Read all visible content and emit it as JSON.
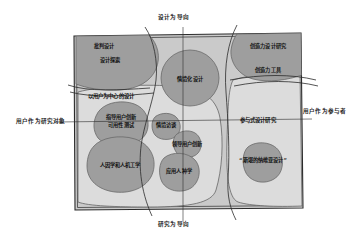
{
  "diagram": {
    "title_axes": {
      "top": "设计为导向",
      "bottom": "研究为导向",
      "left": "用户作为研究对象",
      "right": "用户作为参与者"
    },
    "regions": [
      {
        "id": "user-centered-design",
        "label": "以用户为中心的设计",
        "fill": "#d8d8d8"
      },
      {
        "id": "participatory-design-research",
        "label": "参与式设计研究",
        "fill": "#d8d8d8"
      }
    ],
    "clusters": [
      {
        "id": "critical-design",
        "label": "批判设计",
        "fill": "#9a9a9a"
      },
      {
        "id": "design-exploration",
        "label": "设计探索",
        "fill": "#9a9a9a"
      },
      {
        "id": "creativity-design-research",
        "label": "创造力设计研究",
        "fill": "#9a9a9a"
      },
      {
        "id": "creativity-tools",
        "label": "创造力工具",
        "fill": "#9a9a9a"
      },
      {
        "id": "contextual-design",
        "label": "情境化设计",
        "fill": "#9a9a9a"
      },
      {
        "id": "lead-user-innovation-usability",
        "label_line1": "指导用户创新",
        "label_line2": "可用性测试",
        "fill": "#9a9a9a"
      },
      {
        "id": "contextual-inquiry",
        "label": "情境访谈",
        "fill": "#9a9a9a"
      },
      {
        "id": "lead-user-innovation",
        "label": "领导用户创新",
        "fill": "#9a9a9a"
      },
      {
        "id": "human-factors-ergonomics",
        "label": "人因学和人机工学",
        "fill": "#9a9a9a"
      },
      {
        "id": "applied-ethnography",
        "label": "应用人种学",
        "fill": "#9a9a9a"
      },
      {
        "id": "scandinavian-design",
        "label": "“斯堪的纳维亚设计”",
        "fill": "#9a9a9a"
      }
    ],
    "colors": {
      "background": "#ffffff",
      "frame_stroke": "#2b2b2b",
      "outer_fill": "#cfcfcf",
      "region_fill": "#dcdcdc",
      "blob_fill": "#9e9e9e",
      "blob_stroke": "#6f6f6f",
      "text": "#111111"
    }
  }
}
